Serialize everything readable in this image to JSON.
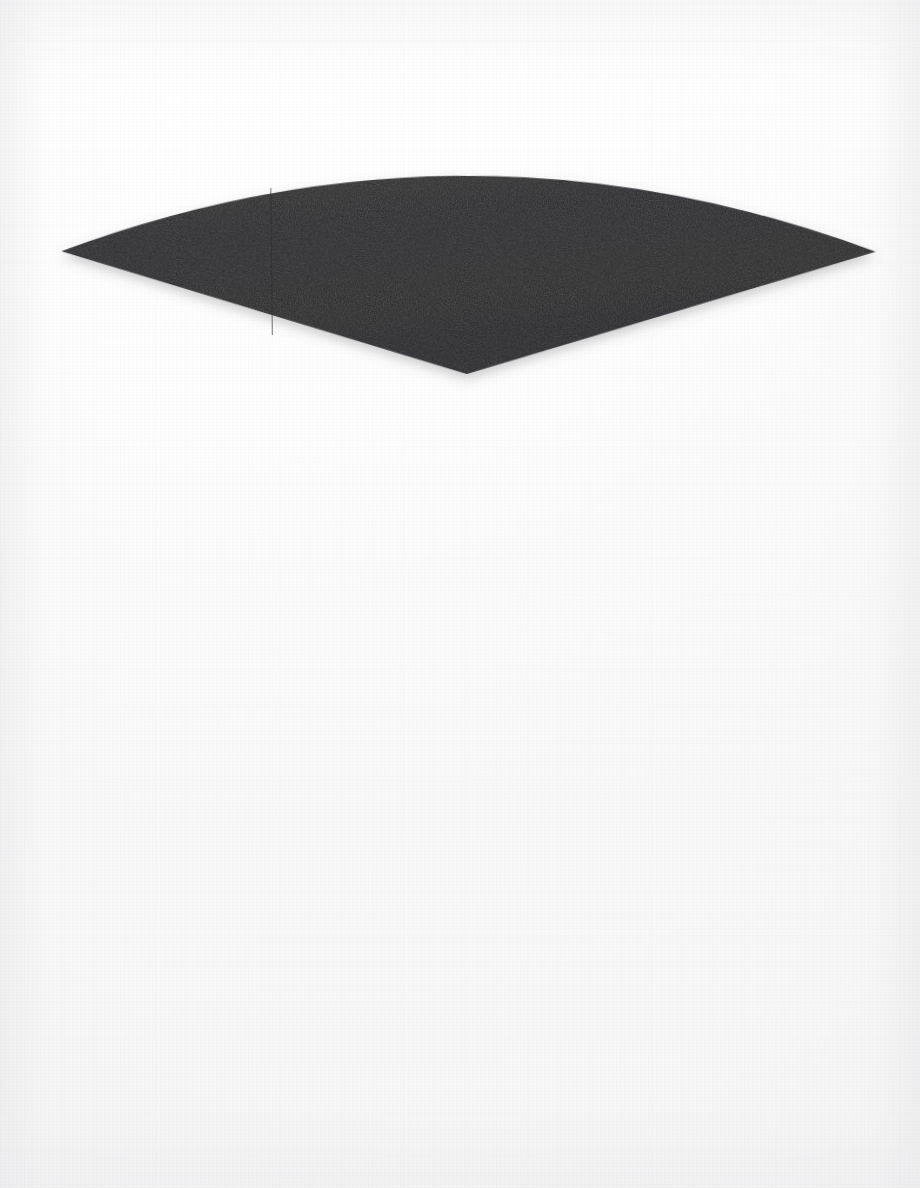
{
  "artwork": {
    "title": "Dark Fan Wedge",
    "medium": "flat geometric shape on paper ground",
    "orientation": "portrait",
    "canvas_width": 920,
    "canvas_height": 1188,
    "background_color": "#fbfbfb",
    "background_description": "near-white off-white paper ground with faint fibrous texture and a subtle cool vignette toward the edges",
    "shape_color": "#262628",
    "shape_description": "solid very dark charcoal circular sector (fan / wedge) with its point at the bottom and a convex arc across the top; the two lower edges are straight radii, and the whole form is tilted very slightly clockwise",
    "shape_count": 1,
    "has_text": false,
    "has_shadow": true,
    "shadow_description": "soft diffuse drop shadow below the two straight lower edges"
  },
  "geometry": {
    "type": "circular-sector",
    "apex": {
      "x": 466,
      "y": 374,
      "label": "bottom apex vertex"
    },
    "left_tip": {
      "x": 62,
      "y": 247,
      "label": "left arc terminus"
    },
    "right_tip": {
      "x": 876,
      "y": 256,
      "label": "right arc terminus"
    },
    "arc_crest": {
      "x": 470,
      "y": 179,
      "label": "top arc apex"
    },
    "rotation_deg": -0.6,
    "arc_bulge": "upward (convex)",
    "lower_edges": "straight radii from apex to each tip",
    "path_d": "M 466 374 L 62 247 Q 470 100 876 256 Z"
  },
  "palette": {
    "shape": "#262628",
    "shape_highlight": "#313133",
    "shape_shadow_inner": "#1f1f21",
    "paper_light": "#ffffff",
    "paper_mid": "#fafafa",
    "paper_edge": "#eeeef0",
    "drop_shadow": "rgba(90,90,96,0.30)"
  }
}
